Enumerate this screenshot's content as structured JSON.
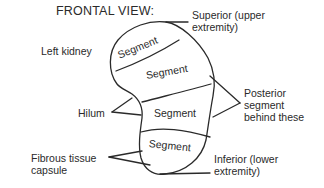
{
  "diagram": {
    "title": "FRONTAL VIEW:",
    "organ_label": "Left kidney",
    "segments": [
      {
        "label": "Segment"
      },
      {
        "label": "Segment"
      },
      {
        "label": "Segment"
      },
      {
        "label": "Segment"
      }
    ],
    "callouts": {
      "superior": "Superior (upper\nextremity)",
      "posterior": "Posterior\nsegment\nbehind these",
      "hilum": "Hilum",
      "capsule": "Fibrous tissue\ncapsule",
      "inferior": "Inferior (lower\nextremity)"
    },
    "colors": {
      "line": "#2a2a2a",
      "text": "#2a2a2a",
      "background": "#ffffff"
    }
  }
}
